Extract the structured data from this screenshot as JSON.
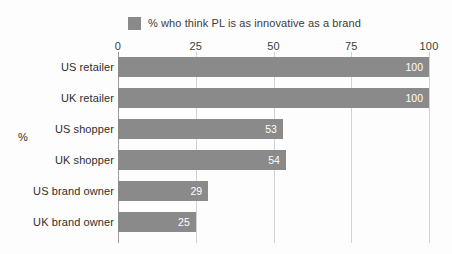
{
  "chart_data": {
    "type": "bar",
    "orientation": "horizontal",
    "title": "",
    "subtitle": "",
    "xlabel": "",
    "ylabel": "%",
    "xlim": [
      0,
      100
    ],
    "xticks": [
      0,
      25,
      50,
      75,
      100
    ],
    "grid": true,
    "legend_position": "top-center",
    "legend": [
      "% who think PL is as innovative as a brand"
    ],
    "series_color": "#8a8a8a",
    "value_label_color": "#ffffff",
    "categories": [
      "US retailer",
      "UK retailer",
      "US shopper",
      "UK shopper",
      "US brand owner",
      "UK brand owner"
    ],
    "series": [
      {
        "name": "% who think PL is as innovative as a brand",
        "values": [
          100,
          100,
          53,
          54,
          29,
          25
        ]
      }
    ],
    "value_labels": [
      "100",
      "100",
      "53",
      "54",
      "29",
      "25"
    ]
  },
  "legend": {
    "swatch_name": "legend-color-swatch",
    "label": "% who think PL is as innovative as a brand"
  },
  "axes": {
    "y_title": "%",
    "x_tick_labels": [
      "0",
      "25",
      "50",
      "75",
      "100"
    ]
  }
}
